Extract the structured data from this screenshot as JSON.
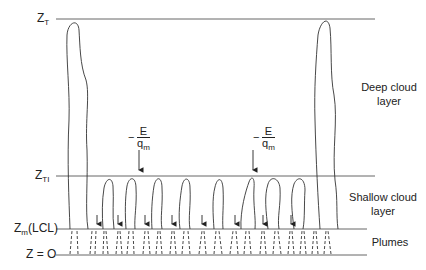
{
  "diagram": {
    "levels": [
      {
        "id": "zt",
        "label": "Z",
        "sub": "T",
        "y": 19
      },
      {
        "id": "zti",
        "label": "Z",
        "sub": "TI",
        "y": 176
      },
      {
        "id": "zm",
        "label": "Z",
        "sub": "m",
        "suffix": "(LCL)",
        "y": 229
      },
      {
        "id": "z0",
        "label": "Z = O",
        "y": 255
      }
    ],
    "regions": {
      "deep": {
        "line1": "Deep cloud",
        "line2": "layer"
      },
      "shallow": {
        "line1": "Shallow cloud",
        "line2": "layer"
      },
      "plumes": {
        "line1": "Plumes"
      }
    },
    "entrainment": {
      "minus": "−",
      "numerator": "E",
      "denominator": "q",
      "denominator_sub": "m"
    },
    "colors": {
      "line": "#555555",
      "ink": "#222222",
      "background": "#ffffff"
    }
  }
}
